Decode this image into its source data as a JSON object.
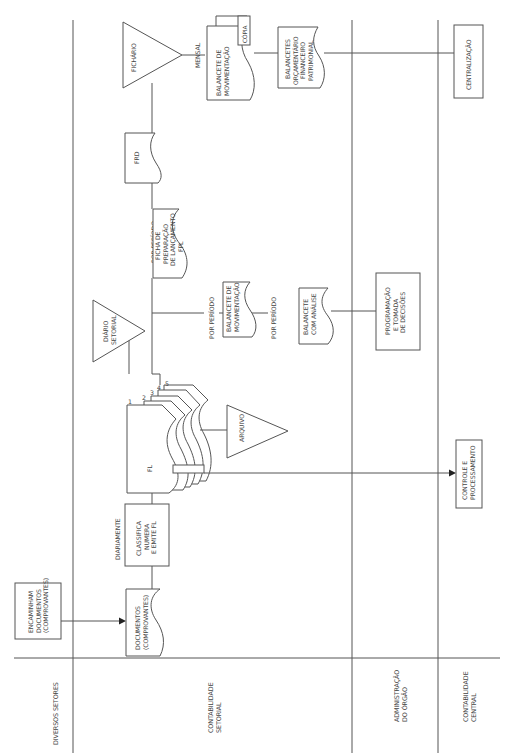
{
  "diagram": {
    "orientation": "rotated-90-ccw",
    "lanes": [
      {
        "id": "diversos",
        "label": [
          "DIVERSOS SETORES"
        ]
      },
      {
        "id": "setorial",
        "label": [
          "CONTABILIDADE",
          "SETORIAL"
        ]
      },
      {
        "id": "admin",
        "label": [
          "ADMINISTRAÇÃO",
          "DO ÓRGÃO"
        ]
      },
      {
        "id": "central",
        "label": [
          "CONTABILIDADE",
          "CENTRAL"
        ]
      }
    ],
    "nodes": {
      "encaminham": [
        "ENCAMINHAM",
        "DOCUMENTOS",
        "(COMPROVANTES)"
      ],
      "documentos": [
        "DOCUMENTOS",
        "(COMPROVANTES)"
      ],
      "classifica": [
        "CLASSIFICA",
        "NUMERA",
        "E EMITE FL"
      ],
      "fl": [
        "FL"
      ],
      "fl_copies": [
        "1",
        "2",
        "3",
        "4",
        "5"
      ],
      "arquivo": [
        "ARQUIVO"
      ],
      "diario_setorial": [
        "DIÁRIO",
        "SETORIAL"
      ],
      "balancete_mov": [
        "BALANCETE DE",
        "MOVIMENTAÇÃO"
      ],
      "balancete_analise": [
        "BALANCETE",
        "COM ANÁLISE"
      ],
      "programacao": [
        "PROGRAMAÇÃO",
        "E TOMADA",
        "DE DECISÕES"
      ],
      "controle": [
        "CONTROLE E",
        "PROCESSAMENTO"
      ],
      "ficha_fpl": [
        "FICHA DE",
        "PREPARAÇÃO",
        "DE LANÇAMENTO",
        "FPL"
      ],
      "frd": [
        "FRD"
      ],
      "fichario": [
        "FICHÁRIO"
      ],
      "balancete_mensal": [
        "BALANCETE DE",
        "MOVIMENTAÇÃO"
      ],
      "copia": [
        "CÓPIA"
      ],
      "balancetes_orc": [
        "BALANCETES",
        "ORÇAMENTÁRIO",
        "FINANCEIRO",
        "PATRIMONIAL"
      ],
      "centralizacao": [
        "CENTRALIZAÇÃO"
      ]
    },
    "annotations": {
      "diariamente": "DIARIAMENTE",
      "por_periodo_1": "POR PERÍODO",
      "por_periodo_2": "POR PERÍODO",
      "por_periodo_3": "POR PERÍODO",
      "mensal": "MENSAL"
    }
  }
}
